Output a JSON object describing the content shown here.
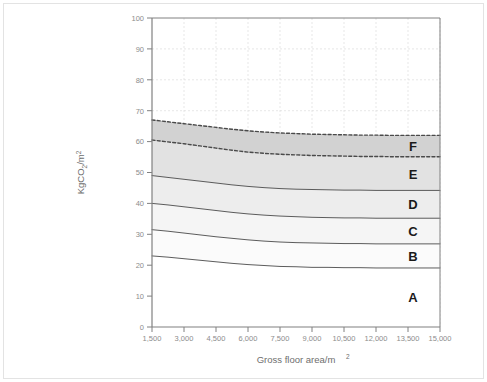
{
  "chart_data": {
    "type": "area",
    "title": "",
    "xlabel": "Gross floor area/m",
    "xlabel_sup": "2",
    "ylabel": "KgCO",
    "ylabel_sub": "2",
    "ylabel_tail": "/m",
    "ylabel_sup": "2",
    "xlim": [
      1500,
      15000
    ],
    "ylim": [
      0,
      100
    ],
    "grid": true,
    "legend_position": "inline-right",
    "xticks": [
      1500,
      3000,
      4500,
      6000,
      7500,
      9000,
      10500,
      12000,
      13500,
      15000
    ],
    "xticklabels": [
      "1,500",
      "3,000",
      "4,500",
      "6,000",
      "7,500",
      "9,000",
      "10,500",
      "12,000",
      "13,500",
      "15,000"
    ],
    "yticks": [
      0,
      10,
      20,
      30,
      40,
      50,
      60,
      70,
      80,
      90,
      100
    ],
    "yticklabels": [
      "0",
      "10",
      "20",
      "30",
      "40",
      "50",
      "60",
      "70",
      "80",
      "90",
      "100"
    ],
    "x": [
      1500,
      2250,
      3000,
      3750,
      4500,
      5250,
      6000,
      6750,
      7500,
      8250,
      9000,
      9750,
      10500,
      11250,
      12000,
      12750,
      13500,
      14250,
      15000
    ],
    "series": [
      {
        "name": "F upper boundary",
        "band_label": "F",
        "line_style": "dashed",
        "fill": "#d2d2d2",
        "values": [
          67.0,
          66.4,
          65.8,
          65.2,
          64.6,
          64.0,
          63.5,
          63.1,
          62.8,
          62.6,
          62.4,
          62.3,
          62.2,
          62.1,
          62.1,
          62.0,
          62.0,
          62.0,
          62.0
        ]
      },
      {
        "name": "E/F boundary",
        "band_label": "E",
        "line_style": "dashed",
        "fill": "#e2e2e2",
        "values": [
          60.5,
          59.9,
          59.3,
          58.6,
          57.9,
          57.2,
          56.6,
          56.2,
          55.9,
          55.7,
          55.5,
          55.4,
          55.3,
          55.2,
          55.2,
          55.1,
          55.1,
          55.1,
          55.1
        ]
      },
      {
        "name": "D/E boundary",
        "band_label": "D",
        "line_style": "solid",
        "fill": "#ededed",
        "values": [
          49.0,
          48.4,
          47.8,
          47.2,
          46.6,
          46.0,
          45.5,
          45.1,
          44.8,
          44.6,
          44.5,
          44.4,
          44.3,
          44.3,
          44.2,
          44.2,
          44.2,
          44.2,
          44.2
        ]
      },
      {
        "name": "C/D boundary",
        "band_label": "C",
        "line_style": "solid",
        "fill": "#f5f5f5",
        "values": [
          40.0,
          39.5,
          38.9,
          38.3,
          37.7,
          37.1,
          36.6,
          36.2,
          35.9,
          35.7,
          35.5,
          35.4,
          35.3,
          35.3,
          35.2,
          35.2,
          35.2,
          35.2,
          35.2
        ]
      },
      {
        "name": "B/C boundary",
        "band_label": "B",
        "line_style": "solid",
        "fill": "#fbfbfb",
        "values": [
          31.5,
          31.0,
          30.4,
          29.8,
          29.2,
          28.7,
          28.2,
          27.8,
          27.5,
          27.3,
          27.2,
          27.1,
          27.0,
          27.0,
          26.9,
          26.9,
          26.9,
          26.9,
          26.9
        ]
      },
      {
        "name": "A/B boundary",
        "band_label": "A",
        "line_style": "solid",
        "fill": "#ffffff",
        "values": [
          23.0,
          22.6,
          22.1,
          21.6,
          21.1,
          20.6,
          20.2,
          19.9,
          19.6,
          19.5,
          19.3,
          19.3,
          19.2,
          19.2,
          19.1,
          19.1,
          19.1,
          19.1,
          19.1
        ]
      }
    ],
    "band_labels": [
      "F",
      "E",
      "D",
      "C",
      "B",
      "A"
    ],
    "colors": {
      "grid": "#dcdcdc",
      "axis": "#808080",
      "line": "#4a4a4a",
      "tick_text": "#8c8c8c",
      "axis_title": "#6e6e6e",
      "band_text": "#1a1a1a",
      "frame": "#e3e3e3",
      "background": "#ffffff"
    }
  }
}
